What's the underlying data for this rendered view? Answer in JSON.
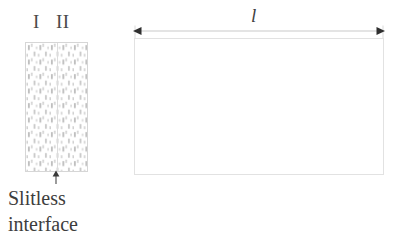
{
  "figure": {
    "background_color": "#ffffff",
    "line_color": "#d6d6d6",
    "text_color": "#3a3a3a"
  },
  "specimen": {
    "region_left_label": "I",
    "region_right_label": "II",
    "caption": "Slitless interface",
    "caption_line_1": "Slitless",
    "caption_line_2": "interface",
    "pattern": "speckled-dash-fill",
    "divider_name": "slitless-interface-line"
  },
  "domain": {
    "length_label": "l",
    "arrow_style": "double-headed"
  }
}
